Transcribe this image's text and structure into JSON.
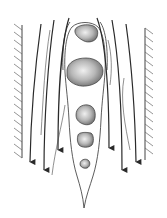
{
  "diagram": {
    "colors": {
      "background": "#ffffff",
      "line": "#2a2a2a",
      "hatch": "#555555",
      "particle_fill_light": "#e6e6e6",
      "particle_fill_dark": "#7a7a7a",
      "particle_stroke": "#3a3a3a"
    },
    "walls": [
      {
        "side": "left",
        "x": 22,
        "y_top": 25,
        "y_bottom": 158,
        "hatch_direction": "left"
      },
      {
        "side": "right",
        "x": 145,
        "y_top": 28,
        "y_bottom": 160,
        "hatch_direction": "right"
      }
    ],
    "particles": [
      {
        "cx": 86,
        "cy": 33,
        "rx": 12,
        "ry": 9
      },
      {
        "cx": 85,
        "cy": 71,
        "rx": 18,
        "ry": 15
      },
      {
        "cx": 86,
        "cy": 115,
        "rx": 10,
        "ry": 10
      },
      {
        "cx": 86,
        "cy": 140,
        "rx": 8,
        "ry": 7
      },
      {
        "cx": 85,
        "cy": 164,
        "rx": 5,
        "ry": 4
      }
    ],
    "streamlines_count": 6,
    "arrow_direction": "down",
    "labels": []
  }
}
